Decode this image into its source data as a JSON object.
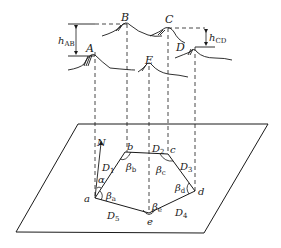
{
  "figure": {
    "type": "surveying-traverse-diagram",
    "ink_color": "#1a1a1a",
    "background": "#ffffff"
  },
  "terrain_points": [
    {
      "id": "A",
      "label": "A"
    },
    {
      "id": "B",
      "label": "B"
    },
    {
      "id": "C",
      "label": "C"
    },
    {
      "id": "D",
      "label": "D"
    },
    {
      "id": "E",
      "label": "E"
    }
  ],
  "height_differences": [
    {
      "id": "hAB",
      "symbol": "h",
      "subscript": "AB"
    },
    {
      "id": "hCD",
      "symbol": "h",
      "subscript": "CD"
    }
  ],
  "plan_points": [
    {
      "id": "a",
      "label": "a"
    },
    {
      "id": "b",
      "label": "b"
    },
    {
      "id": "c",
      "label": "c"
    },
    {
      "id": "d",
      "label": "d"
    },
    {
      "id": "e",
      "label": "e"
    }
  ],
  "distances": [
    {
      "id": "D1",
      "symbol": "D",
      "subscript": "1"
    },
    {
      "id": "D2",
      "symbol": "D",
      "subscript": "2"
    },
    {
      "id": "D3",
      "symbol": "D",
      "subscript": "3"
    },
    {
      "id": "D4",
      "symbol": "D",
      "subscript": "4"
    },
    {
      "id": "D5",
      "symbol": "D",
      "subscript": "5"
    }
  ],
  "angles": [
    {
      "id": "beta_a",
      "symbol": "β",
      "subscript": "a"
    },
    {
      "id": "beta_b",
      "symbol": "β",
      "subscript": "b"
    },
    {
      "id": "beta_c",
      "symbol": "β",
      "subscript": "c"
    },
    {
      "id": "beta_d",
      "symbol": "β",
      "subscript": "d"
    },
    {
      "id": "beta_e",
      "symbol": "β",
      "subscript": "e"
    },
    {
      "id": "alpha",
      "symbol": "α",
      "subscript": ""
    }
  ],
  "north": {
    "label": "N"
  }
}
